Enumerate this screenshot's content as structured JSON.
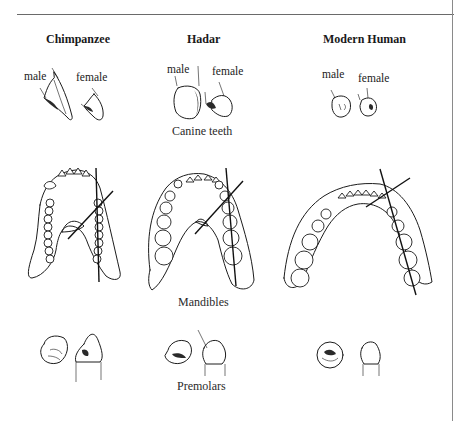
{
  "figure": {
    "columns": [
      {
        "title": "Chimpanzee",
        "canine_labels": {
          "male": "male",
          "female": "female"
        }
      },
      {
        "title": "Hadar",
        "canine_labels": {
          "male": "male",
          "female": "female"
        }
      },
      {
        "title": "Modern Human",
        "canine_labels": {
          "male": "male",
          "female": "female"
        }
      }
    ],
    "row_captions": {
      "canines": "Canine teeth",
      "mandibles": "Mandibles",
      "premolars": "Premolars"
    }
  }
}
